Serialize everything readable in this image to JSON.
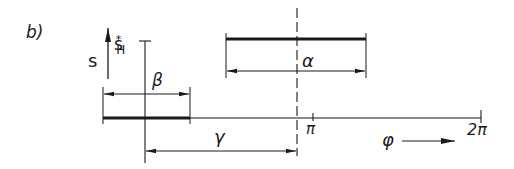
{
  "figure": {
    "panel_label": "b)",
    "colors": {
      "ink": "#1a1a1a",
      "background": "#ffffff"
    }
  },
  "labels": {
    "s": "s",
    "s_h_base": "s",
    "s_h_sup": "*",
    "s_h_sub": "H",
    "beta": "β",
    "alpha": "α",
    "gamma": "γ",
    "pi": "π",
    "two_pi": "2π",
    "phi": "φ"
  },
  "axis": {
    "variable": "φ",
    "ticks": [
      "π",
      "2π"
    ]
  },
  "dimensions": [
    {
      "name": "beta",
      "label": "β"
    },
    {
      "name": "alpha",
      "label": "α"
    },
    {
      "name": "gamma",
      "label": "γ"
    }
  ]
}
